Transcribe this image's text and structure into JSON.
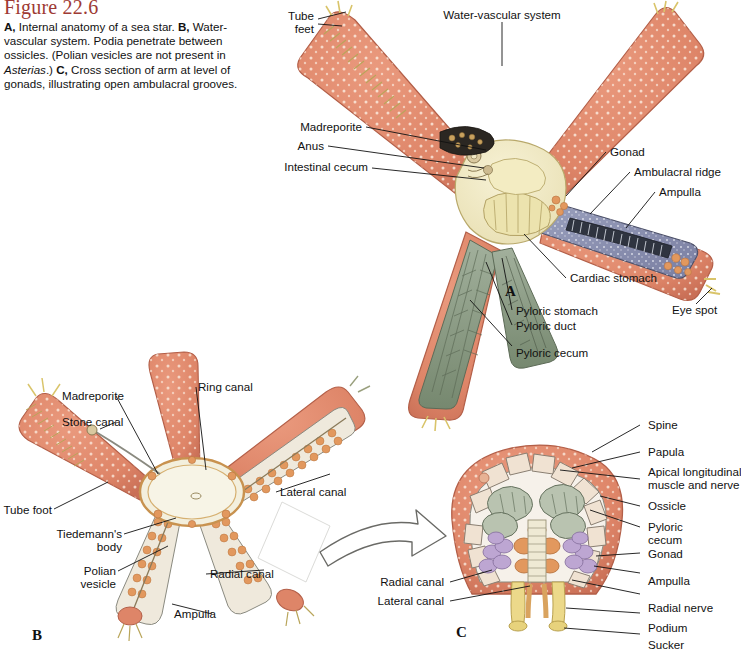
{
  "figure": {
    "number": "Figure 22.6",
    "caption_runs": [
      {
        "t": "A,",
        "b": true
      },
      {
        "t": " Internal anatomy of a sea star. ",
        "b": false
      },
      {
        "t": "B,",
        "b": true
      },
      {
        "t": " Water-vascular system. Podia penetrate between ossicles. (Polian vesicles are not present in ",
        "b": false
      },
      {
        "t": "Asterias",
        "i": true
      },
      {
        "t": ".) ",
        "b": false
      },
      {
        "t": "C,",
        "b": true
      },
      {
        "t": " Cross section of arm at level of gonads, illustrating open ambulacral grooves.",
        "b": false
      }
    ],
    "caption_plain": "A, Internal anatomy of a sea star. B, Water-vascular system. Podia penetrate between ossicles. (Polian vesicles are not present in Asterias.) C, Cross section of arm at level of gonads, illustrating open ambulacral grooves."
  },
  "panels": {
    "a": {
      "letter": "A",
      "labels": {
        "tube_feet_l1": "Tube",
        "tube_feet_l2": "feet",
        "water_vascular_system": "Water-vascular system",
        "madreporite": "Madreporite",
        "anus": "Anus",
        "intestinal_cecum": "Intestinal cecum",
        "gonad": "Gonad",
        "ambulacral_ridge": "Ambulacral ridge",
        "ampulla": "Ampulla",
        "cardiac_stomach": "Cardiac stomach",
        "pyloric_stomach": "Pyloric stomach",
        "pyloric_duct": "Pyloric duct",
        "pyloric_cecum": "Pyloric cecum",
        "eye_spot": "Eye spot"
      }
    },
    "b": {
      "letter": "B",
      "labels": {
        "madreporite": "Madreporite",
        "stone_canal": "Stone canal",
        "ring_canal": "Ring canal",
        "tube_foot": "Tube foot",
        "tiedemanns_l1": "Tiedemann's",
        "tiedemanns_l2": "body",
        "polian_l1": "Polian",
        "polian_l2": "vesicle",
        "lateral_canal": "Lateral canal",
        "radial_canal": "Radial canal",
        "ampulla": "Ampulla"
      }
    },
    "c": {
      "letter": "C",
      "labels": {
        "spine": "Spine",
        "papula": "Papula",
        "apical_l1": "Apical longitudinal",
        "apical_l2": "muscle and nerve",
        "ossicle": "Ossicle",
        "pyloric_l1": "Pyloric",
        "pyloric_l2": "cecum",
        "gonad": "Gonad",
        "ampulla": "Ampulla",
        "radial_nerve": "Radial nerve",
        "podium": "Podium",
        "sucker": "Sucker",
        "radial_canal": "Radial canal",
        "lateral_canal": "Lateral canal"
      }
    }
  },
  "colors": {
    "title": "#9e3a34",
    "body_salmon": "#e08a6e",
    "body_salmon_dark": "#c9705a",
    "disc_cream": "#f2ecc4",
    "pyloric_green": "#8e9e8a",
    "ampulla_blue": "#8b90b0",
    "gonad_purple": "#b9a3cc",
    "ampulla_orange": "#e2985e",
    "ossicle_cream": "#f0e2d2",
    "podium_yellow": "#e8d77e",
    "leader": "#111111",
    "text": "#111111"
  }
}
